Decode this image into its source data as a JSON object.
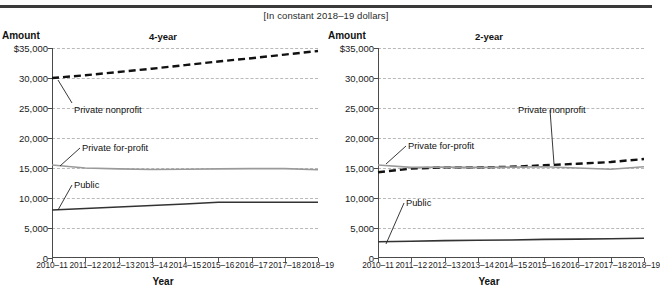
{
  "subtitle": "[In constant 2018–19 dollars]",
  "axis_title_x": "Year",
  "axis_title_y": "Amount",
  "panels": [
    {
      "key": "four_year",
      "title": "4-year"
    },
    {
      "key": "two_year",
      "title": "2-year"
    }
  ],
  "ytick_labels": [
    "$35,000",
    "30,000",
    "25,000",
    "20,000",
    "15,000",
    "10,000",
    "5,000",
    "0"
  ],
  "xtick_labels": [
    "2010–11",
    "2011–12",
    "2012–13",
    "2013–14",
    "2014–15",
    "2015–16",
    "2016–17",
    "2017–18",
    "2018–19"
  ],
  "annotations": {
    "four_year": {
      "private_nonprofit": "Private nonprofit",
      "private_forprofit": "Private for-profit",
      "public": "Public"
    },
    "two_year": {
      "private_nonprofit": "Private nonprofit",
      "private_forprofit": "Private for-profit",
      "public": "Public"
    }
  },
  "colors": {
    "public": "#333333",
    "private_nonprofit": "#111111",
    "private_forprofit": "#9a9a9a",
    "grid": "#b9b9b9",
    "axis": "#4a4a4a",
    "rule": "#3a3a3a"
  },
  "chart_data": [
    {
      "type": "line",
      "title": "4-year",
      "subtitle": "[In constant 2018–19 dollars]",
      "xlabel": "Year",
      "ylabel": "Amount",
      "ylim": [
        0,
        35000
      ],
      "ytick_values": [
        0,
        5000,
        10000,
        15000,
        20000,
        25000,
        30000,
        35000
      ],
      "grid": true,
      "legend": "inline-annotations",
      "x": [
        "2010–11",
        "2011–12",
        "2012–13",
        "2013–14",
        "2014–15",
        "2015–16",
        "2016–17",
        "2017–18",
        "2018–19"
      ],
      "series": [
        {
          "name": "Private nonprofit",
          "style": "dashed",
          "color": "#111111",
          "values": [
            30000,
            30450,
            31000,
            31550,
            32150,
            32750,
            33300,
            33900,
            34500
          ]
        },
        {
          "name": "Private for-profit",
          "style": "solid",
          "color": "#9a9a9a",
          "values": [
            15500,
            15000,
            14850,
            14750,
            14800,
            14850,
            14900,
            14900,
            14700
          ]
        },
        {
          "name": "Public",
          "style": "solid",
          "color": "#333333",
          "values": [
            8000,
            8250,
            8500,
            8750,
            9000,
            9300,
            9300,
            9300,
            9300
          ]
        }
      ]
    },
    {
      "type": "line",
      "title": "2-year",
      "subtitle": "[In constant 2018–19 dollars]",
      "xlabel": "Year",
      "ylabel": "Amount",
      "ylim": [
        0,
        35000
      ],
      "ytick_values": [
        0,
        5000,
        10000,
        15000,
        20000,
        25000,
        30000,
        35000
      ],
      "grid": true,
      "legend": "inline-annotations",
      "x": [
        "2010–11",
        "2011–12",
        "2012–13",
        "2013–14",
        "2014–15",
        "2015–16",
        "2016–17",
        "2017–18",
        "2018–19"
      ],
      "series": [
        {
          "name": "Private nonprofit",
          "style": "dashed",
          "color": "#111111",
          "values": [
            14300,
            14900,
            15100,
            15100,
            15200,
            15450,
            15700,
            16000,
            16500
          ]
        },
        {
          "name": "Private for-profit",
          "style": "solid",
          "color": "#9a9a9a",
          "values": [
            15500,
            15100,
            15150,
            15100,
            15150,
            15200,
            15000,
            14800,
            15200
          ]
        },
        {
          "name": "Public",
          "style": "solid",
          "color": "#333333",
          "values": [
            2700,
            2800,
            2900,
            2950,
            3000,
            3100,
            3150,
            3200,
            3300
          ]
        }
      ]
    }
  ]
}
